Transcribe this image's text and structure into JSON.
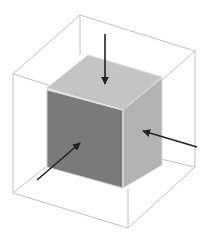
{
  "diagram": {
    "colors": {
      "background": "#ffffff",
      "wireframe": "#b0b0b0",
      "top_face": "#c4c4c4",
      "front_face": "#7a7a7a",
      "right_face": "#b3b3b3",
      "edge": "#d8d8d8",
      "arrow": "#222222"
    },
    "arrows": [
      {
        "name": "top-arrow",
        "target_face": "top"
      },
      {
        "name": "front-arrow",
        "target_face": "front-left"
      },
      {
        "name": "right-arrow",
        "target_face": "right"
      }
    ]
  }
}
